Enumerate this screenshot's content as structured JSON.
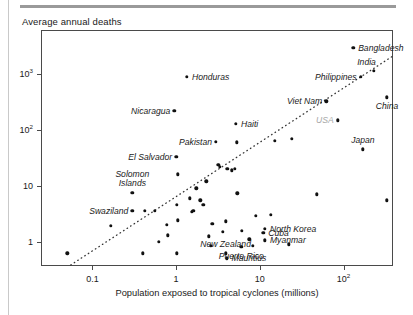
{
  "page": {
    "top_rule": true,
    "left_border": true
  },
  "chart_data": {
    "type": "scatter",
    "title": "Average annual deaths",
    "xlabel": "Population exposed to tropical cyclones (millions)",
    "ylabel": "Average annual deaths",
    "xscale": "log",
    "yscale": "log",
    "xlim": [
      0.025,
      400
    ],
    "ylim": [
      0.35,
      6000
    ],
    "grid": false,
    "legend": null,
    "xticks": [
      {
        "value": 0.1,
        "label": "0.1"
      },
      {
        "value": 1,
        "label": "1"
      },
      {
        "value": 10,
        "label": "10"
      },
      {
        "value": 100,
        "label": "10",
        "sup": "2"
      }
    ],
    "yticks": [
      {
        "value": 1,
        "label": "1"
      },
      {
        "value": 10,
        "label": "10"
      },
      {
        "value": 100,
        "label": "10",
        "sup": "2"
      },
      {
        "value": 1000,
        "label": "10",
        "sup": "3"
      }
    ],
    "trendline": {
      "style": "dotted",
      "x_start": 0.055,
      "y_start": 0.38,
      "x_end": 400,
      "y_end": 2200
    },
    "labeled_points": [
      {
        "name": "Bangladesh",
        "x": 130,
        "y": 3000,
        "label_side": "right"
      },
      {
        "name": "India",
        "x": 230,
        "y": 1150,
        "label_side": "above-left"
      },
      {
        "name": "Philippines",
        "x": 160,
        "y": 900,
        "label_side": "left"
      },
      {
        "name": "Viet Nam",
        "x": 62,
        "y": 330,
        "label_side": "left"
      },
      {
        "name": "USA",
        "x": 85,
        "y": 150,
        "label_side": "left",
        "muted": true
      },
      {
        "name": "China",
        "x": 330,
        "y": 390,
        "label_side": "below"
      },
      {
        "name": "Japan",
        "x": 170,
        "y": 45,
        "label_side": "above"
      },
      {
        "name": "Honduras",
        "x": 1.35,
        "y": 900,
        "label_side": "right"
      },
      {
        "name": "Nicaragua",
        "x": 0.95,
        "y": 220,
        "label_side": "left"
      },
      {
        "name": "Haiti",
        "x": 5.2,
        "y": 130,
        "label_side": "right"
      },
      {
        "name": "Pakistan",
        "x": 3.0,
        "y": 62,
        "label_side": "left"
      },
      {
        "name": "El Salvador",
        "x": 1.0,
        "y": 33,
        "label_side": "left"
      },
      {
        "name": "Solomon Islands",
        "x": 0.3,
        "y": 7.5,
        "label_side": "above",
        "two_line": true
      },
      {
        "name": "Swaziland",
        "x": 0.3,
        "y": 3.6,
        "label_side": "left"
      },
      {
        "name": "North Korea",
        "x": 11.5,
        "y": 1.7,
        "label_side": "right"
      },
      {
        "name": "Cuba",
        "x": 11.0,
        "y": 1.45,
        "label_side": "right"
      },
      {
        "name": "Myanmar",
        "x": 11.5,
        "y": 1.05,
        "label_side": "right"
      },
      {
        "name": "Puerto Rico",
        "x": 6.0,
        "y": 0.8,
        "label_side": "below"
      },
      {
        "name": "New Zealand",
        "x": 3.9,
        "y": 0.62,
        "label_side": "above"
      },
      {
        "name": "Mauritius",
        "x": 4.0,
        "y": 0.5,
        "label_side": "right"
      }
    ],
    "unlabeled_points": [
      {
        "x": 0.05,
        "y": 0.62
      },
      {
        "x": 0.165,
        "y": 1.9
      },
      {
        "x": 0.42,
        "y": 3.6
      },
      {
        "x": 0.56,
        "y": 3.6
      },
      {
        "x": 0.4,
        "y": 0.62
      },
      {
        "x": 0.62,
        "y": 1.0
      },
      {
        "x": 0.78,
        "y": 2.0
      },
      {
        "x": 0.8,
        "y": 1.3
      },
      {
        "x": 1.02,
        "y": 4.6
      },
      {
        "x": 1.05,
        "y": 2.4
      },
      {
        "x": 1.02,
        "y": 0.62
      },
      {
        "x": 1.05,
        "y": 16
      },
      {
        "x": 1.45,
        "y": 6.0
      },
      {
        "x": 1.55,
        "y": 3.4
      },
      {
        "x": 1.6,
        "y": 3.6
      },
      {
        "x": 1.75,
        "y": 9.0
      },
      {
        "x": 1.95,
        "y": 5.5
      },
      {
        "x": 2.1,
        "y": 4.6
      },
      {
        "x": 2.3,
        "y": 12
      },
      {
        "x": 2.45,
        "y": 1.25
      },
      {
        "x": 2.6,
        "y": 0.85
      },
      {
        "x": 2.7,
        "y": 2.1
      },
      {
        "x": 3.2,
        "y": 24
      },
      {
        "x": 3.3,
        "y": 22
      },
      {
        "x": 3.6,
        "y": 1.5
      },
      {
        "x": 3.9,
        "y": 2.3
      },
      {
        "x": 4.1,
        "y": 20
      },
      {
        "x": 4.6,
        "y": 19
      },
      {
        "x": 5.0,
        "y": 20
      },
      {
        "x": 5.3,
        "y": 60
      },
      {
        "x": 5.4,
        "y": 7.3
      },
      {
        "x": 6.1,
        "y": 1.55
      },
      {
        "x": 7.5,
        "y": 1.1
      },
      {
        "x": 8.2,
        "y": 0.85
      },
      {
        "x": 9.0,
        "y": 2.9
      },
      {
        "x": 13.5,
        "y": 3.0
      },
      {
        "x": 15.0,
        "y": 65
      },
      {
        "x": 22.0,
        "y": 0.9
      },
      {
        "x": 24.0,
        "y": 70
      },
      {
        "x": 48.0,
        "y": 7.0
      },
      {
        "x": 330,
        "y": 5.5
      }
    ]
  }
}
